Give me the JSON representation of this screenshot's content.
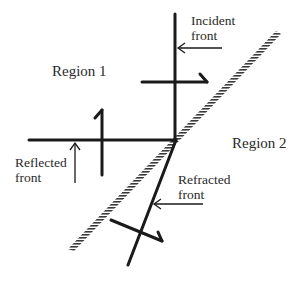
{
  "diagram": {
    "regions": [
      {
        "id": "region-1",
        "label": "Region 1",
        "x": 52,
        "y": 76
      },
      {
        "id": "region-2",
        "label": "Region 2",
        "x": 232,
        "y": 148
      }
    ],
    "labels": {
      "incident": [
        "Incident",
        "front"
      ],
      "reflected": [
        "Reflected",
        "front"
      ],
      "refracted": [
        "Refracted",
        "front"
      ]
    },
    "colors": {
      "line": "#1a1a1a",
      "text": "#2a2a2a",
      "hatch": "#3a3a3a",
      "background": "#ffffff"
    }
  }
}
